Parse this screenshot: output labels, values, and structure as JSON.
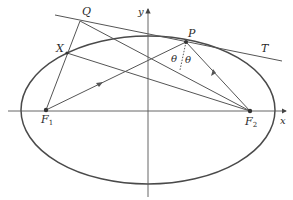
{
  "diagram": {
    "type": "ellipse-reflection-property",
    "colors": {
      "line": "#555555",
      "ellipse": "#4a4a4a",
      "text": "#2a2a2a",
      "background": "#ffffff"
    },
    "axes": {
      "x_label": "x",
      "y_label": "y"
    },
    "points": {
      "P": "P",
      "Q": "Q",
      "X": "X",
      "F1": "F",
      "F1_sub": "1",
      "F2": "F",
      "F2_sub": "2"
    },
    "tangent_label": "T",
    "angle_labels": [
      "θ",
      "θ"
    ]
  }
}
